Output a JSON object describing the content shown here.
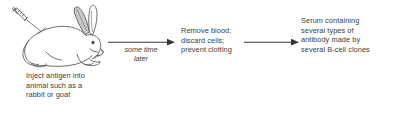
{
  "diagram": {
    "background_color": "#ffffff",
    "ink_color": "#3c3c3c",
    "steps": [
      {
        "id": "step-1",
        "illustration": "rabbit-with-syringe",
        "caption": "Inject antigen into\nanimal such as a\nrabbit or goat"
      },
      {
        "id": "step-2",
        "caption": "Remove blood;\ndiscard cells;\nprevent clotting"
      },
      {
        "id": "step-3",
        "caption": "Serum containing\nseveral types of\nantibody made by\nseveral B-cell clones"
      }
    ],
    "arrows": [
      {
        "id": "arrow-1",
        "label": "some time\nlater",
        "style": "italic"
      },
      {
        "id": "arrow-2",
        "label": ""
      }
    ]
  }
}
